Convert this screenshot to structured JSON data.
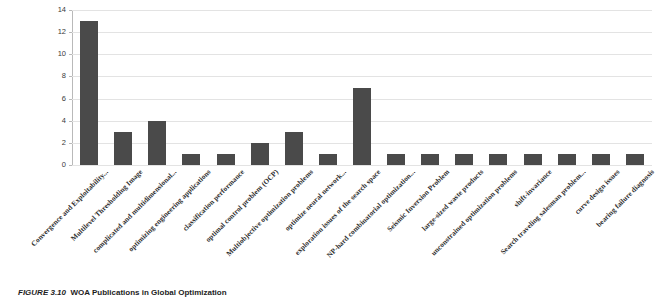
{
  "caption": {
    "label": "FIGURE 3.10",
    "text": "WOA Publications in Global Optimization"
  },
  "chart_data": {
    "type": "bar",
    "title": "",
    "xlabel": "",
    "ylabel": "",
    "ylim": [
      0,
      14
    ],
    "yticks": [
      0,
      2,
      4,
      6,
      8,
      10,
      12,
      14
    ],
    "grid": true,
    "legend": "none",
    "bar_color": "#4a4a4a",
    "categories": [
      "Convergence and Exploitability...",
      "Multilevel Thresholding Image",
      "complicated and multidimensional...",
      "optimizing engineering applications",
      "classification performance",
      "optimal control problem (OCP)",
      "Multiobjective optimization problems",
      "optimize neural network...",
      "exploration issues of the search space",
      "NP-hard combinatorial optimization...",
      "Seismic Inversion Problem",
      "large-sized waste products",
      "unconstrained optimization problems",
      "shift-invariance",
      "Search traveling salesman problem...",
      "curve design issues",
      "bearing failure diagnosis"
    ],
    "values": [
      13,
      3,
      4,
      1,
      1,
      2,
      3,
      1,
      7,
      1,
      1,
      1,
      1,
      1,
      1,
      1,
      1
    ]
  }
}
